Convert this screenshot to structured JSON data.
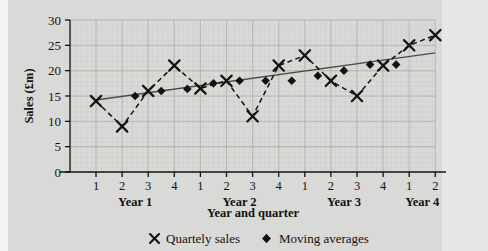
{
  "chart_data": {
    "type": "line",
    "title": "",
    "xlabel": "Year and quarter",
    "ylabel": "Sales (£m)",
    "ylim": [
      0,
      30
    ],
    "yticks": [
      0,
      5,
      10,
      15,
      20,
      25,
      30
    ],
    "ytick_labels": [
      "0",
      "5",
      "10",
      "15",
      "20",
      "25",
      "30"
    ],
    "grid": true,
    "grid_minor": true,
    "legend_position": "below",
    "x_quarter_labels": [
      "1",
      "2",
      "3",
      "4",
      "1",
      "2",
      "3",
      "4",
      "1",
      "2",
      "3",
      "4",
      "1",
      "2"
    ],
    "x_group_labels": [
      "Year 1",
      "Year 2",
      "Year 3",
      "Year 4"
    ],
    "x_axis_max_index": 14,
    "series": [
      {
        "name": "Quartely sales",
        "marker": "x",
        "linestyle": "dashed",
        "x": [
          1,
          2,
          3,
          4,
          5,
          6,
          7,
          8,
          9,
          10,
          11,
          12,
          13,
          14
        ],
        "x_period_labels": [
          "Year 1 Q1",
          "Year 1 Q2",
          "Year 1 Q3",
          "Year 1 Q4",
          "Year 2 Q1",
          "Year 2 Q2",
          "Year 2 Q3",
          "Year 2 Q4",
          "Year 3 Q1",
          "Year 3 Q2",
          "Year 3 Q3",
          "Year 3 Q4",
          "Year 4 Q1",
          "Year 4 Q2"
        ],
        "values": [
          14,
          9,
          16,
          21,
          16.5,
          18,
          11,
          21,
          23,
          18,
          15,
          21,
          25,
          27
        ]
      },
      {
        "name": "Moving averages",
        "marker": "diamond",
        "linestyle": "none",
        "x": [
          2.5,
          3.5,
          4.5,
          5.5,
          6.5,
          7.5,
          8.5,
          9.5,
          10.5,
          11.5,
          12.5
        ],
        "values": [
          15,
          16,
          16.4,
          17.5,
          18,
          18,
          18,
          19,
          20,
          21.2,
          21.2
        ]
      },
      {
        "name": "Trend line",
        "marker": "none",
        "linestyle": "solid",
        "x": [
          1,
          14
        ],
        "values": [
          14.2,
          23.5
        ]
      }
    ],
    "legend": [
      {
        "label": "Quartely sales",
        "marker": "x"
      },
      {
        "label": "Moving averages",
        "marker": "diamond"
      }
    ]
  },
  "colors": {
    "background": "#d9d9d7",
    "grid_major": "#aeaeac",
    "grid_minor": "#c6c6c3",
    "axis": "#14120f",
    "series_quarterly": "#14120f",
    "series_moving_average": "#14120f",
    "trend_line": "#4a4a48"
  }
}
